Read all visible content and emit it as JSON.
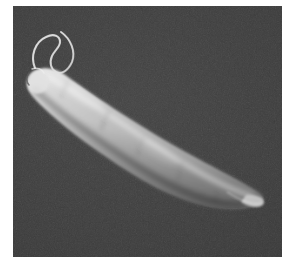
{
  "figure": {
    "kind": "sem-micrograph",
    "caption": "",
    "panel": {
      "x": 13,
      "y": 6,
      "width": 269,
      "height": 251,
      "background_color": "#3b3b3b",
      "border_color": "#ffffff"
    },
    "page_background_color": "#ffffff"
  },
  "specimen": {
    "name": "flagellate-cell-body",
    "body_color_bright": "#dcdcdc",
    "body_color_mid": "#b4b4b4",
    "body_color_shadow": "#6e6e6e",
    "flagellum_color": "#c8c8c8",
    "orientation": "anterior upper-left, posterior lower-right",
    "anterior_end": {
      "x": 28,
      "y": 72
    },
    "posterior_tip": {
      "x": 259,
      "y": 196
    },
    "max_width_px": 34,
    "length_px": 258,
    "flagellum": {
      "name": "anterior-flagellum",
      "attachment_point": {
        "x": 30,
        "y": 66
      },
      "apex_point": {
        "x": 58,
        "y": 27
      },
      "stroke_width_px": 2,
      "shape": "open loop curving up-left then right and back down"
    }
  },
  "annotations": {
    "scale_bar_text": "",
    "label_text": ""
  }
}
